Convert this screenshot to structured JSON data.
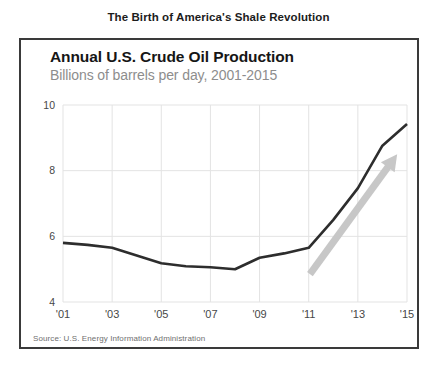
{
  "header": {
    "title": "The Birth of America's Shale Revolution"
  },
  "chart_data": {
    "type": "line",
    "title": "Annual U.S. Crude Oil Production",
    "subtitle": "Billions of barrels per day, 2001-2015",
    "source": "Source: U.S. Energy Information Administration",
    "x": [
      2001,
      2002,
      2003,
      2004,
      2005,
      2006,
      2007,
      2008,
      2009,
      2010,
      2011,
      2012,
      2013,
      2014,
      2015
    ],
    "values": [
      5.8,
      5.74,
      5.65,
      5.42,
      5.18,
      5.09,
      5.06,
      5.0,
      5.35,
      5.48,
      5.65,
      6.5,
      7.47,
      8.76,
      9.42
    ],
    "x_tick_years": [
      2001,
      2003,
      2005,
      2007,
      2009,
      2011,
      2013,
      2015
    ],
    "x_tick_labels": [
      "'01",
      "'03",
      "'05",
      "'07",
      "'09",
      "'11",
      "'13",
      "'15"
    ],
    "y_ticks": [
      4,
      6,
      8,
      10
    ],
    "y_tick_labels": [
      "4",
      "6",
      "8",
      "10"
    ],
    "xlim": [
      2001,
      2015
    ],
    "ylim": [
      4,
      10
    ],
    "grid": "horizontal and vertical light gridlines",
    "legend": "none",
    "annotation_arrow": {
      "x1": 2011.05,
      "y1": 4.85,
      "x2": 2014.6,
      "y2": 8.5
    },
    "colors": {
      "line": "#2d2d2d",
      "grid": "#e3e3e3",
      "arrow": "#c7c7c7",
      "tick_text": "#474747",
      "subtitle_text": "#8d8d8d",
      "source_text": "#6f6f6f",
      "box_border": "#3a3a3a"
    }
  }
}
